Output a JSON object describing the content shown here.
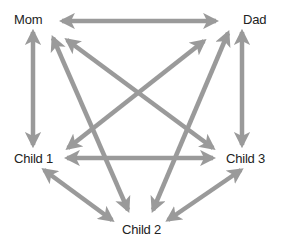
{
  "diagram": {
    "type": "family-relationship-graph",
    "arrow_color": "#9a9a9a",
    "nodes": {
      "mom": {
        "label": "Mom",
        "x": 14,
        "y": 12
      },
      "dad": {
        "label": "Dad",
        "x": 243,
        "y": 12
      },
      "child1": {
        "label": "Child 1",
        "x": 14,
        "y": 151
      },
      "child2": {
        "label": "Child 2",
        "x": 122,
        "y": 222
      },
      "child3": {
        "label": "Child 3",
        "x": 226,
        "y": 151
      }
    },
    "edges": [
      {
        "from": "Mom",
        "to": "Dad",
        "bidirectional": true
      },
      {
        "from": "Mom",
        "to": "Child 1",
        "bidirectional": true
      },
      {
        "from": "Dad",
        "to": "Child 3",
        "bidirectional": true
      },
      {
        "from": "Child 1",
        "to": "Child 3",
        "bidirectional": true
      },
      {
        "from": "Child 1",
        "to": "Child 2",
        "bidirectional": true
      },
      {
        "from": "Child 3",
        "to": "Child 2",
        "bidirectional": true
      },
      {
        "from": "Mom",
        "to": "Child 3",
        "bidirectional": true
      },
      {
        "from": "Mom",
        "to": "Child 2",
        "bidirectional": true
      },
      {
        "from": "Dad",
        "to": "Child 1",
        "bidirectional": true
      },
      {
        "from": "Dad",
        "to": "Child 2",
        "bidirectional": true
      }
    ]
  }
}
